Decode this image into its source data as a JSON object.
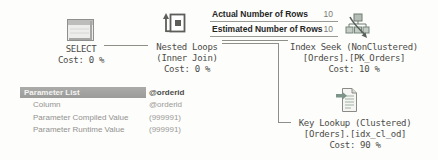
{
  "plan": {
    "nodes": {
      "select": {
        "line1": "SELECT",
        "line2": "",
        "cost": "Cost: 0 %"
      },
      "nested_loops": {
        "line1": "Nested Loops",
        "line2": "(Inner Join)",
        "cost": "Cost: 0 %"
      },
      "index_seek": {
        "line1": "Index Seek (NonClustered)",
        "line2": "[Orders].[PK_Orders]",
        "cost": "Cost: 10 %"
      },
      "key_lookup": {
        "line1": "Key Lookup (Clustered)",
        "line2": "[Orders].[idx_cl_od]",
        "cost": "Cost: 90 %"
      }
    },
    "icons": {
      "select": "result-window-icon",
      "nested_loops": "nested-loops-icon",
      "index_seek": "index-seek-icon",
      "key_lookup": "key-lookup-icon"
    }
  },
  "tooltip": {
    "rows": [
      {
        "label": "Actual Number of Rows",
        "value": "10"
      },
      {
        "label": "Estimated Number of Rows",
        "value": "10"
      }
    ]
  },
  "parameter_panel": {
    "header": {
      "label": "Parameter List",
      "value": "@orderid"
    },
    "rows": [
      {
        "label": "Column",
        "value": "@orderid"
      },
      {
        "label": "Parameter Compiled Value",
        "value": "(999991)"
      },
      {
        "label": "Parameter Runtime Value",
        "value": "(999991)"
      }
    ]
  },
  "colors": {
    "background": "#fdfdfc",
    "plan_text": "#4c4c48",
    "edge_line": "#8f8f8a",
    "tooltip_label": "#26261f",
    "tooltip_value": "#7a7a74",
    "panel_header_bg": "#a1a19f",
    "panel_header_text": "#f4f4f2",
    "panel_row_text": "#92928e",
    "icon_accent_green": "#7d9488"
  }
}
